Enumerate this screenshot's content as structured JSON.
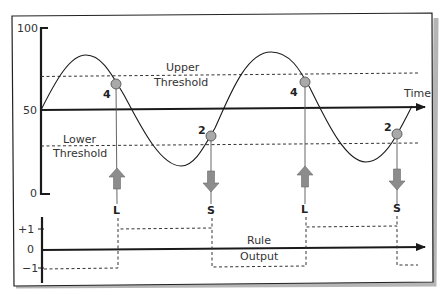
{
  "diagram": {
    "type": "threshold-trading-rule",
    "upper_panel": {
      "y_axis_ticks": [
        "100",
        "50",
        "0"
      ],
      "time_label": "Time",
      "upper_threshold_label": [
        "Upper",
        "Threshold"
      ],
      "lower_threshold_label": [
        "Lower",
        "Threshold"
      ],
      "crossing_points": [
        {
          "label": "4",
          "direction": "down-through-upper",
          "signal": "L",
          "arrow": "up"
        },
        {
          "label": "2",
          "direction": "up-through-lower",
          "signal": "S",
          "arrow": "down"
        },
        {
          "label": "4",
          "direction": "down-through-upper",
          "signal": "L",
          "arrow": "up"
        },
        {
          "label": "2",
          "direction": "up-through-lower",
          "signal": "S",
          "arrow": "down"
        }
      ]
    },
    "signals": [
      "L",
      "S",
      "L",
      "S"
    ],
    "lower_panel": {
      "y_axis_ticks": [
        "+1",
        "0",
        "−1"
      ],
      "output_label": [
        "Rule",
        "Output"
      ],
      "output_sequence": [
        "-1",
        "+1",
        "-1",
        "+1",
        "-1"
      ]
    },
    "colors": {
      "line": "#1a1a1a",
      "marker_fill": "#a9a9a9",
      "arrow_fill": "#8c8c8c",
      "frame_shadow": "#9a9a9a"
    }
  }
}
